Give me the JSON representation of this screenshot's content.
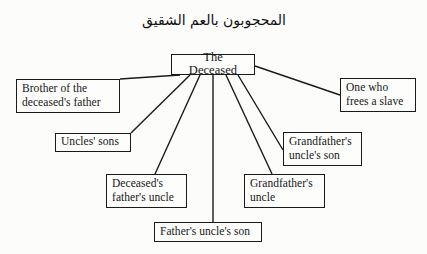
{
  "page": {
    "background_color": "#fcfcfb",
    "ink_color": "#1a1a1a"
  },
  "caption": {
    "text": "المحجوبون بالعم الشقيق"
  },
  "diagram": {
    "type": "radial-tree",
    "root": {
      "label": "The Deceased",
      "x": 171,
      "y": 54,
      "width": 84,
      "height": 21
    },
    "nodes": [
      {
        "id": "brother-of-deceaseds-father",
        "label": "Brother of the\ndeceased's father",
        "x": 16,
        "y": 79,
        "width": 104,
        "height": 34,
        "edge_from": "bottom",
        "anchor_x": 180,
        "anchor_y": 75,
        "target_x": 120,
        "target_y": 79
      },
      {
        "id": "uncles-sons",
        "label": "Uncles' sons",
        "x": 55,
        "y": 133,
        "width": 76,
        "height": 19,
        "edge_from": "bottom",
        "anchor_x": 190,
        "anchor_y": 75,
        "target_x": 131,
        "target_y": 133
      },
      {
        "id": "deceaseds-fathers-uncle",
        "label": "Deceased's\nfather's uncle",
        "x": 106,
        "y": 174,
        "width": 81,
        "height": 34,
        "edge_from": "bottom",
        "anchor_x": 200,
        "anchor_y": 75,
        "target_x": 155,
        "target_y": 174
      },
      {
        "id": "fathers-uncles-son",
        "label": "Father's uncle's son",
        "x": 154,
        "y": 222,
        "width": 108,
        "height": 20,
        "edge_from": "bottom",
        "anchor_x": 213,
        "anchor_y": 75,
        "target_x": 213,
        "target_y": 222
      },
      {
        "id": "grandfathers-uncle",
        "label": "Grandfather's\nuncle",
        "x": 244,
        "y": 174,
        "width": 81,
        "height": 34,
        "edge_from": "bottom",
        "anchor_x": 226,
        "anchor_y": 75,
        "target_x": 272,
        "target_y": 174
      },
      {
        "id": "grandfathers-uncles-son",
        "label": "Grandfather's\nuncle's son",
        "x": 283,
        "y": 132,
        "width": 79,
        "height": 34,
        "edge_from": "bottom",
        "anchor_x": 238,
        "anchor_y": 75,
        "target_x": 283,
        "target_y": 150
      },
      {
        "id": "one-who-frees-a-slave",
        "label": "One who\nfrees a slave",
        "x": 340,
        "y": 78,
        "width": 76,
        "height": 34,
        "edge_from": "right",
        "anchor_x": 255,
        "anchor_y": 66,
        "target_x": 340,
        "target_y": 95
      }
    ]
  }
}
